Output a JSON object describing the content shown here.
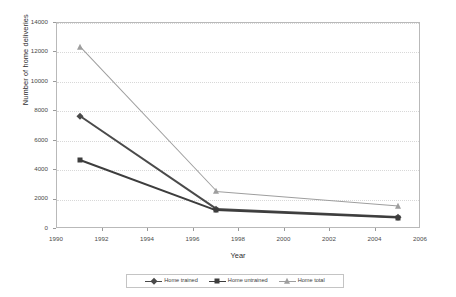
{
  "chart_data": {
    "type": "line",
    "title": "",
    "xlabel": "Year",
    "ylabel": "Number of home deliveries",
    "x": [
      1991,
      1997,
      2005
    ],
    "xlim": [
      1990,
      2006
    ],
    "ylim": [
      0,
      14000
    ],
    "xticks": [
      "1990",
      "1992",
      "1994",
      "1996",
      "1998",
      "2000",
      "2002",
      "2004",
      "2006"
    ],
    "xtick_values": [
      1990,
      1992,
      1994,
      1996,
      1998,
      2000,
      2002,
      2004,
      2006
    ],
    "yticks": [
      "0",
      "2000",
      "4000",
      "6000",
      "8000",
      "10000",
      "12000",
      "14000"
    ],
    "ytick_values": [
      0,
      2000,
      4000,
      6000,
      8000,
      10000,
      12000,
      14000
    ],
    "grid": true,
    "grid_axis": "y",
    "legend_position": "bottom",
    "series": [
      {
        "name": "Home trained",
        "marker": "diamond",
        "color": "#4a4a4a",
        "values": [
          7650,
          1330,
          790
        ]
      },
      {
        "name": "Home untrained",
        "marker": "square",
        "color": "#3d3d3d",
        "values": [
          4700,
          1270,
          760
        ]
      },
      {
        "name": "Home total",
        "marker": "triangle",
        "color": "#9e9e9e",
        "values": [
          12380,
          2550,
          1570
        ]
      }
    ]
  },
  "colors": {
    "plot_border": "#b9b9b9",
    "gridline": "#d8d8d8",
    "axis_text": "#4a4a4a",
    "background": "#ffffff"
  }
}
